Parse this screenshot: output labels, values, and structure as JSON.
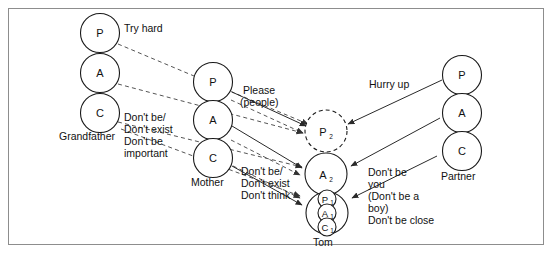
{
  "diagram": {
    "people": [
      {
        "id": "grandfather",
        "name": "Grandfather",
        "states": [
          "P",
          "A",
          "C"
        ]
      },
      {
        "id": "mother",
        "name": "Mother",
        "states": [
          "P",
          "A",
          "C"
        ]
      },
      {
        "id": "partner",
        "name": "Partner",
        "states": [
          "P",
          "A",
          "C"
        ]
      },
      {
        "id": "tom",
        "name": "Tom",
        "states": [
          "P2",
          "A2",
          "P1",
          "A1",
          "C1"
        ]
      }
    ],
    "node_labels": {
      "parent": "P",
      "adult": "A",
      "child": "C",
      "p2": "P",
      "p2_sub": "2",
      "a2": "A",
      "a2_sub": "2",
      "p1": "P",
      "p1_sub": "1",
      "a1": "A",
      "a1_sub": "1",
      "c1": "C",
      "c1_sub": "1"
    },
    "messages": [
      {
        "id": "try-hard",
        "text": "Try hard",
        "from": "grandfather",
        "to": "tom"
      },
      {
        "id": "please-people",
        "line1": "Please",
        "line2": "(people)",
        "from": "mother",
        "to": "tom"
      },
      {
        "id": "hurry-up",
        "text": "Hurry up",
        "from": "partner",
        "to": "tom"
      }
    ],
    "injunctions": [
      {
        "id": "grandfather-injunctions",
        "lines": [
          "Don't be/",
          "Don't exist",
          "Don't be",
          "important"
        ]
      },
      {
        "id": "mother-injunctions",
        "lines": [
          "Don't be/",
          "Don't exist",
          "Don't think"
        ]
      },
      {
        "id": "partner-injunctions",
        "lines": [
          "Don't be",
          "you",
          "(Don't be a",
          "boy)",
          "Don't be close"
        ]
      }
    ],
    "colors": {
      "frame": "#8d8d8d",
      "stroke": "#1a1a1a",
      "solid_edge": "#2a2a2a",
      "dashed_edge": "#555555",
      "background": "#ffffff",
      "text": "#111111"
    }
  }
}
